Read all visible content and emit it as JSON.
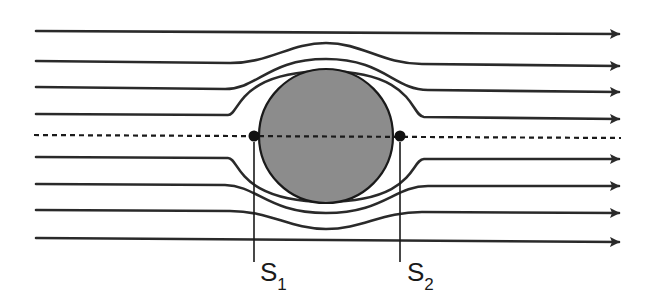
{
  "diagram": {
    "colors": {
      "line": "#2a2a2a",
      "cylinder_fill": "#8c8c8c",
      "cylinder_stroke": "#1a1a1a",
      "background": "#ffffff"
    },
    "cylinder": {
      "cx": 326,
      "cy": 136,
      "r": 68
    },
    "axis": {
      "y": 136,
      "x_start": 34,
      "x_end": 621,
      "style": "dashed"
    },
    "streamlines": [
      {
        "id": "top-1",
        "y": 31,
        "deflection": 0
      },
      {
        "id": "top-2",
        "y": 61,
        "deflection": -18
      },
      {
        "id": "top-3",
        "y": 87,
        "deflection": -27
      },
      {
        "id": "top-4",
        "y": 114,
        "deflection": -40
      },
      {
        "id": "bottom-4",
        "y": 157,
        "deflection": 40
      },
      {
        "id": "bottom-3",
        "y": 184,
        "deflection": 27
      },
      {
        "id": "bottom-2",
        "y": 210,
        "deflection": 18
      },
      {
        "id": "bottom-1",
        "y": 238,
        "deflection": 0
      }
    ],
    "stagnation_points": [
      {
        "id": "S1",
        "label_main": "S",
        "label_sub": "1",
        "x": 254,
        "y": 136
      },
      {
        "id": "S2",
        "label_main": "S",
        "label_sub": "2",
        "x": 400,
        "y": 136
      }
    ]
  }
}
